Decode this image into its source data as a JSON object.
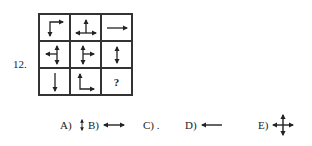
{
  "question": {
    "number": "12.",
    "grid": [
      [
        {
          "icon": "corner-right-down-arrows"
        },
        {
          "icon": "three-way-up-left-right-arrows"
        },
        {
          "icon": "right-arrow"
        }
      ],
      [
        {
          "icon": "three-way-up-down-left-arrows"
        },
        {
          "icon": "three-way-up-down-right-arrows"
        },
        {
          "icon": "up-down-arrow"
        }
      ],
      [
        {
          "icon": "down-arrow"
        },
        {
          "icon": "corner-up-right-arrows"
        },
        {
          "icon": "question-mark",
          "text": "?"
        }
      ]
    ],
    "options": [
      {
        "label": "A)",
        "icon": "up-down-arrow"
      },
      {
        "label": "B)",
        "icon": "left-right-arrow"
      },
      {
        "label": "C) .",
        "icon": "dot"
      },
      {
        "label": "D)",
        "icon": "left-arrow"
      },
      {
        "label": "E)",
        "icon": "four-way-arrows"
      }
    ]
  }
}
